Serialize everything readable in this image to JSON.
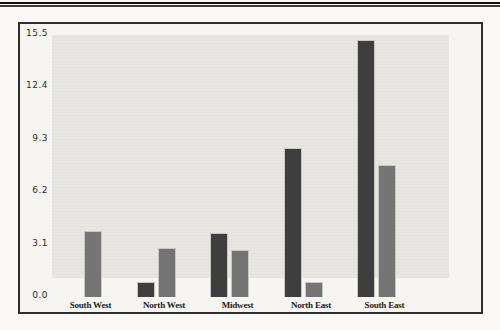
{
  "colors": {
    "page_background": "#f9f8f5",
    "frame_background": "#f7f5f1",
    "frame_border": "#2e2e2e",
    "plot_background": "#e8e6e1",
    "series1_bar": "#3e3e3e",
    "series2_bar": "#747474",
    "top_rule": "#111111"
  },
  "chart_data": {
    "type": "bar",
    "title": "",
    "xlabel": "",
    "ylabel": "",
    "categories": [
      "South West",
      "North West",
      "Midwest",
      "North East",
      "South East"
    ],
    "series": [
      {
        "name": "Series 1",
        "color": "#3e3e3e",
        "values": [
          0,
          0.9,
          3.8,
          8.8,
          15.2
        ]
      },
      {
        "name": "Series 2",
        "color": "#747474",
        "values": [
          3.9,
          2.9,
          2.8,
          0.9,
          7.8
        ]
      }
    ],
    "ylim": [
      0,
      15.5
    ],
    "yticks": [
      "0.0",
      "3.1",
      "6.2",
      "9.3",
      "12.4",
      "15.5"
    ],
    "grid": false,
    "legend": "none"
  }
}
